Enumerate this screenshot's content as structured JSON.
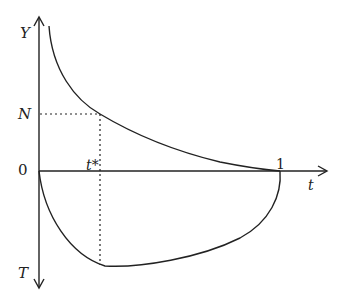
{
  "diagram": {
    "axis_labels": {
      "y_top": "Y",
      "y_bottom": "T",
      "x": "t",
      "origin": "0",
      "x_end": "1",
      "n_level": "N",
      "t_star": "t*"
    },
    "curves": [
      {
        "name": "upper-curve",
        "description": "decreasing convex curve from top-left to (1,0)"
      },
      {
        "name": "lower-curve",
        "description": "U-shaped curve below axis from 0 to 1 with minimum near t*"
      }
    ],
    "guides": [
      {
        "name": "n-dotted-line",
        "description": "horizontal dotted line at N to upper curve"
      },
      {
        "name": "t-star-dotted-line",
        "description": "vertical dotted line at t* from N to lower curve"
      }
    ],
    "colors": {
      "line": "#222222",
      "background": "#ffffff"
    }
  }
}
